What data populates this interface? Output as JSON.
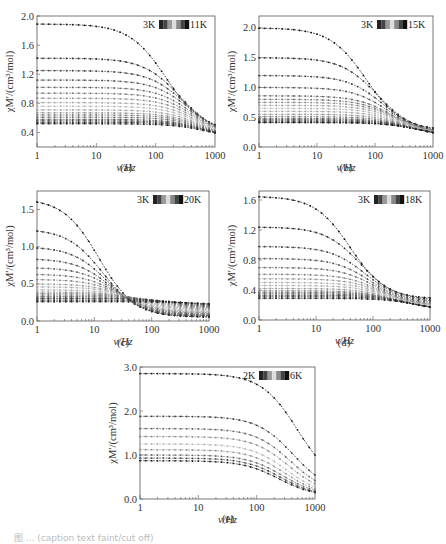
{
  "figure": {
    "caption": "图 ... (caption text faint/cut off)"
  },
  "chart_data": [
    {
      "id": "a",
      "type": "line",
      "panel_label": "(a)",
      "title": "",
      "xlabel": "ν/Hz",
      "ylabel": "χM′/(cm³/mol)",
      "xscale": "log",
      "xlim": [
        1,
        1000
      ],
      "ylim": [
        0.2,
        2.0
      ],
      "xticks": [
        "1",
        "10",
        "100",
        "1000"
      ],
      "yticks": [
        "0.4",
        "0.8",
        "1.2",
        "1.6",
        "2.0"
      ],
      "ytick_values": [
        0.4,
        0.8,
        1.2,
        1.6,
        2.0
      ],
      "legend": {
        "start": "3K",
        "end": "11K",
        "position": "top-right"
      },
      "box": {
        "x": 37,
        "y": 16,
        "w": 178,
        "h": 131
      },
      "series": [
        {
          "name": "3K",
          "low": 1.89,
          "high": 0.41,
          "fc": 150
        },
        {
          "name": "3.5K",
          "low": 1.42,
          "high": 0.36,
          "fc": 260
        },
        {
          "name": "4K",
          "low": 1.25,
          "high": 0.34,
          "fc": 320
        },
        {
          "name": "4.5K",
          "low": 1.12,
          "high": 0.33,
          "fc": 380
        },
        {
          "name": "5K",
          "low": 1.02,
          "high": 0.32,
          "fc": 420
        },
        {
          "name": "5.5K",
          "low": 0.94,
          "high": 0.31,
          "fc": 460
        },
        {
          "name": "6K",
          "low": 0.87,
          "high": 0.31,
          "fc": 500
        },
        {
          "name": "6.5K",
          "low": 0.81,
          "high": 0.3,
          "fc": 540
        },
        {
          "name": "7K",
          "low": 0.76,
          "high": 0.3,
          "fc": 570
        },
        {
          "name": "7.5K",
          "low": 0.71,
          "high": 0.3,
          "fc": 600
        },
        {
          "name": "8K",
          "low": 0.67,
          "high": 0.3,
          "fc": 630
        },
        {
          "name": "8.5K",
          "low": 0.64,
          "high": 0.3,
          "fc": 660
        },
        {
          "name": "9K",
          "low": 0.61,
          "high": 0.3,
          "fc": 690
        },
        {
          "name": "9.5K",
          "low": 0.58,
          "high": 0.3,
          "fc": 720
        },
        {
          "name": "10K",
          "low": 0.56,
          "high": 0.3,
          "fc": 750
        },
        {
          "name": "10.5K",
          "low": 0.54,
          "high": 0.3,
          "fc": 780
        },
        {
          "name": "11K",
          "low": 0.52,
          "high": 0.3,
          "fc": 800
        }
      ]
    },
    {
      "id": "b",
      "type": "line",
      "panel_label": "(b)",
      "title": "",
      "xlabel": "ν/Hz",
      "ylabel": "χM′/(cm³/mol)",
      "xscale": "log",
      "xlim": [
        1,
        1000
      ],
      "ylim": [
        0.0,
        2.2
      ],
      "xticks": [
        "1",
        "10",
        "100",
        "1000"
      ],
      "yticks": [
        "0.0",
        "0.5",
        "1.0",
        "1.5",
        "2.0"
      ],
      "ytick_values": [
        0.0,
        0.5,
        1.0,
        1.5,
        2.0
      ],
      "legend": {
        "start": "3K",
        "end": "15K",
        "position": "top-right"
      },
      "box": {
        "x": 259,
        "y": 16,
        "w": 174,
        "h": 131
      },
      "series": [
        {
          "name": "3K",
          "low": 2.0,
          "high": 0.28,
          "fc": 70
        },
        {
          "name": "3.5K",
          "low": 1.5,
          "high": 0.25,
          "fc": 110
        },
        {
          "name": "4K",
          "low": 1.2,
          "high": 0.23,
          "fc": 140
        },
        {
          "name": "4.5K",
          "low": 1.0,
          "high": 0.22,
          "fc": 170
        },
        {
          "name": "5K",
          "low": 0.86,
          "high": 0.21,
          "fc": 200
        },
        {
          "name": "5.5K",
          "low": 0.8,
          "high": 0.2,
          "fc": 220
        },
        {
          "name": "6K",
          "low": 0.75,
          "high": 0.2,
          "fc": 240
        },
        {
          "name": "6.5K",
          "low": 0.7,
          "high": 0.19,
          "fc": 260
        },
        {
          "name": "7K",
          "low": 0.65,
          "high": 0.19,
          "fc": 280
        },
        {
          "name": "8K",
          "low": 0.6,
          "high": 0.18,
          "fc": 310
        },
        {
          "name": "9K",
          "low": 0.55,
          "high": 0.18,
          "fc": 340
        },
        {
          "name": "10K",
          "low": 0.51,
          "high": 0.18,
          "fc": 380
        },
        {
          "name": "11K",
          "low": 0.48,
          "high": 0.17,
          "fc": 420
        },
        {
          "name": "12K",
          "low": 0.46,
          "high": 0.17,
          "fc": 460
        },
        {
          "name": "13K",
          "low": 0.44,
          "high": 0.17,
          "fc": 500
        },
        {
          "name": "14K",
          "low": 0.42,
          "high": 0.17,
          "fc": 540
        },
        {
          "name": "15K",
          "low": 0.41,
          "high": 0.17,
          "fc": 580
        }
      ]
    },
    {
      "id": "c",
      "type": "line",
      "panel_label": "(c)",
      "title": "",
      "xlabel": "ν/Hz",
      "ylabel": "χM′/(cm³/mol)",
      "xscale": "log",
      "xlim": [
        1,
        1000
      ],
      "ylim": [
        0.0,
        1.75
      ],
      "xticks": [
        "1",
        "10",
        "100",
        "1000"
      ],
      "yticks": [
        "0.0",
        "0.5",
        "1.0",
        "1.5"
      ],
      "ytick_values": [
        0.0,
        0.5,
        1.0,
        1.5
      ],
      "legend": {
        "start": "3K",
        "end": "20K",
        "position": "top-right"
      },
      "box": {
        "x": 37,
        "y": 191,
        "w": 172,
        "h": 130
      },
      "series": [
        {
          "name": "3K",
          "low": 1.65,
          "high": 0.05,
          "fc": 12
        },
        {
          "name": "4K",
          "low": 1.24,
          "high": 0.06,
          "fc": 14
        },
        {
          "name": "5K",
          "low": 1.0,
          "high": 0.07,
          "fc": 17
        },
        {
          "name": "6K",
          "low": 0.84,
          "high": 0.08,
          "fc": 20
        },
        {
          "name": "7K",
          "low": 0.72,
          "high": 0.09,
          "fc": 24
        },
        {
          "name": "8K",
          "low": 0.63,
          "high": 0.1,
          "fc": 28
        },
        {
          "name": "9K",
          "low": 0.56,
          "high": 0.11,
          "fc": 33
        },
        {
          "name": "10K",
          "low": 0.5,
          "high": 0.12,
          "fc": 40
        },
        {
          "name": "11K",
          "low": 0.46,
          "high": 0.13,
          "fc": 50
        },
        {
          "name": "12K",
          "low": 0.42,
          "high": 0.14,
          "fc": 62
        },
        {
          "name": "13K",
          "low": 0.39,
          "high": 0.15,
          "fc": 78
        },
        {
          "name": "14K",
          "low": 0.37,
          "high": 0.16,
          "fc": 100
        },
        {
          "name": "15K",
          "low": 0.35,
          "high": 0.17,
          "fc": 130
        },
        {
          "name": "16K",
          "low": 0.33,
          "high": 0.18,
          "fc": 170
        },
        {
          "name": "17K",
          "low": 0.31,
          "high": 0.19,
          "fc": 220
        },
        {
          "name": "18K",
          "low": 0.3,
          "high": 0.2,
          "fc": 300
        },
        {
          "name": "19K",
          "low": 0.28,
          "high": 0.21,
          "fc": 400
        },
        {
          "name": "20K",
          "low": 0.26,
          "high": 0.22,
          "fc": 600
        }
      ]
    },
    {
      "id": "d",
      "type": "line",
      "panel_label": "(d)",
      "title": "",
      "xlabel": "ν/Hz",
      "ylabel": "χM′/(cm³/mol)",
      "xscale": "log",
      "xlim": [
        1,
        1000
      ],
      "ylim": [
        0.0,
        1.72
      ],
      "xticks": [
        "1",
        "10",
        "100",
        "1000"
      ],
      "yticks": [
        "0.0",
        "0.4",
        "0.8",
        "1.2",
        "1.6"
      ],
      "ytick_values": [
        0.0,
        0.4,
        0.8,
        1.2,
        1.6
      ],
      "legend": {
        "start": "3K",
        "end": "18K",
        "position": "top-right"
      },
      "box": {
        "x": 259,
        "y": 191,
        "w": 171,
        "h": 129
      },
      "series": [
        {
          "name": "3K",
          "low": 1.65,
          "high": 0.28,
          "fc": 40
        },
        {
          "name": "4K",
          "low": 1.24,
          "high": 0.26,
          "fc": 60
        },
        {
          "name": "5K",
          "low": 0.98,
          "high": 0.24,
          "fc": 75
        },
        {
          "name": "6K",
          "low": 0.82,
          "high": 0.22,
          "fc": 90
        },
        {
          "name": "7K",
          "low": 0.7,
          "high": 0.2,
          "fc": 110
        },
        {
          "name": "8K",
          "low": 0.61,
          "high": 0.19,
          "fc": 130
        },
        {
          "name": "9K",
          "low": 0.55,
          "high": 0.18,
          "fc": 150
        },
        {
          "name": "10K",
          "low": 0.5,
          "high": 0.17,
          "fc": 175
        },
        {
          "name": "11K",
          "low": 0.46,
          "high": 0.16,
          "fc": 200
        },
        {
          "name": "12K",
          "low": 0.42,
          "high": 0.15,
          "fc": 230
        },
        {
          "name": "13K",
          "low": 0.39,
          "high": 0.14,
          "fc": 260
        },
        {
          "name": "14K",
          "low": 0.37,
          "high": 0.14,
          "fc": 300
        },
        {
          "name": "15K",
          "low": 0.35,
          "high": 0.13,
          "fc": 350
        },
        {
          "name": "16K",
          "low": 0.33,
          "high": 0.13,
          "fc": 420
        },
        {
          "name": "17K",
          "low": 0.31,
          "high": 0.12,
          "fc": 500
        },
        {
          "name": "18K",
          "low": 0.29,
          "high": 0.12,
          "fc": 600
        }
      ]
    },
    {
      "id": "e",
      "type": "line",
      "panel_label": "(e)",
      "title": "",
      "xlabel": "ν/Hz",
      "ylabel": "χM′/(cm³/mol)",
      "xscale": "log",
      "xlim": [
        1,
        1000
      ],
      "ylim": [
        0.0,
        3.0
      ],
      "xticks": [
        "1",
        "10",
        "100",
        "1000"
      ],
      "yticks": [
        "0.0",
        "1.0",
        "2.0",
        "3.0"
      ],
      "ytick_values": [
        0.0,
        1.0,
        2.0,
        3.0
      ],
      "legend": {
        "start": "2K",
        "end": "6K",
        "position": "top-right"
      },
      "box": {
        "x": 140,
        "y": 367,
        "w": 175,
        "h": 132
      },
      "series": [
        {
          "name": "2K",
          "low": 2.85,
          "high": 0.3,
          "fc": 500
        },
        {
          "name": "2.5K",
          "low": 1.88,
          "high": 0.15,
          "fc": 420
        },
        {
          "name": "3K",
          "low": 1.6,
          "high": 0.12,
          "fc": 380
        },
        {
          "name": "3.5K",
          "low": 1.42,
          "high": 0.1,
          "fc": 350
        },
        {
          "name": "4K",
          "low": 1.25,
          "high": 0.08,
          "fc": 320
        },
        {
          "name": "4.5K",
          "low": 1.12,
          "high": 0.07,
          "fc": 300
        },
        {
          "name": "5K",
          "low": 1.0,
          "high": 0.06,
          "fc": 280
        },
        {
          "name": "5.5K",
          "low": 0.93,
          "high": 0.05,
          "fc": 260
        },
        {
          "name": "6K",
          "low": 0.87,
          "high": 0.05,
          "fc": 240
        }
      ]
    }
  ]
}
